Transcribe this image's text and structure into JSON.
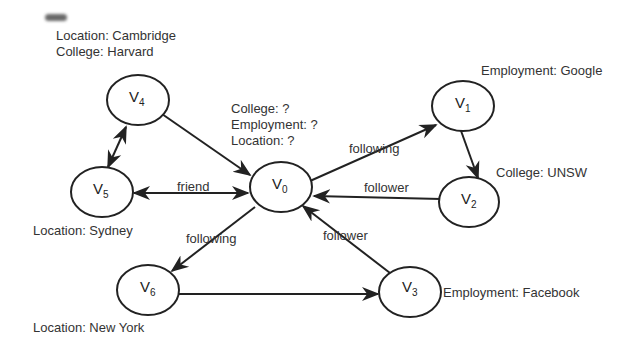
{
  "diagram": {
    "nodes": [
      {
        "id": "V0",
        "base": "V",
        "sub": "0",
        "cx": 280,
        "cy": 186,
        "attributes": [
          "College: ?",
          "Employment: ?",
          "Location: ?"
        ]
      },
      {
        "id": "V1",
        "base": "V",
        "sub": "1",
        "cx": 462,
        "cy": 105,
        "attributes": [
          "Employment: Google"
        ]
      },
      {
        "id": "V2",
        "base": "V",
        "sub": "2",
        "cx": 468,
        "cy": 202,
        "attributes": [
          "College: UNSW"
        ]
      },
      {
        "id": "V3",
        "base": "V",
        "sub": "3",
        "cx": 410,
        "cy": 292,
        "attributes": [
          "Employment: Facebook"
        ]
      },
      {
        "id": "V4",
        "base": "V",
        "sub": "4",
        "cx": 138,
        "cy": 100,
        "attributes": [
          "Location: Cambridge",
          "College: Harvard"
        ]
      },
      {
        "id": "V5",
        "base": "V",
        "sub": "5",
        "cx": 102,
        "cy": 192,
        "attributes": [
          "Location: Sydney"
        ]
      },
      {
        "id": "V6",
        "base": "V",
        "sub": "6",
        "cx": 148,
        "cy": 290,
        "attributes": [
          "Location: New York"
        ]
      }
    ],
    "edges": [
      {
        "from": "V4",
        "to": "V0",
        "label": "",
        "directed": true,
        "bidirectional": false
      },
      {
        "from": "V4",
        "to": "V5",
        "label": "",
        "directed": true,
        "bidirectional": true
      },
      {
        "from": "V5",
        "to": "V0",
        "label": "friend",
        "directed": true,
        "bidirectional": true
      },
      {
        "from": "V0",
        "to": "V1",
        "label": "following",
        "directed": true,
        "bidirectional": false
      },
      {
        "from": "V1",
        "to": "V2",
        "label": "",
        "directed": true,
        "bidirectional": false
      },
      {
        "from": "V2",
        "to": "V0",
        "label": "follower",
        "directed": true,
        "bidirectional": false
      },
      {
        "from": "V0",
        "to": "V6",
        "label": "following",
        "directed": true,
        "bidirectional": false
      },
      {
        "from": "V6",
        "to": "V3",
        "label": "",
        "directed": true,
        "bidirectional": false
      },
      {
        "from": "V3",
        "to": "V0",
        "label": "follower",
        "directed": true,
        "bidirectional": false
      }
    ],
    "annotations": {
      "v4": [
        "Location: Cambridge",
        "College: Harvard"
      ],
      "v0": [
        "College: ?",
        "Employment: ?",
        "Location: ?"
      ],
      "v1": "Employment: Google",
      "v2": "College: UNSW",
      "v5": "Location: Sydney",
      "v6": "Location: New York",
      "v3": "Employment: Facebook"
    },
    "edge_labels": {
      "friend": "friend",
      "v0_v1": "following",
      "v2_v0": "follower",
      "v0_v6": "following",
      "v3_v0": "follower"
    },
    "node_labels": {
      "v0": {
        "base": "V",
        "sub": "0"
      },
      "v1": {
        "base": "V",
        "sub": "1"
      },
      "v2": {
        "base": "V",
        "sub": "2"
      },
      "v3": {
        "base": "V",
        "sub": "3"
      },
      "v4": {
        "base": "V",
        "sub": "4"
      },
      "v5": {
        "base": "V",
        "sub": "5"
      },
      "v6": {
        "base": "V",
        "sub": "6"
      }
    }
  }
}
